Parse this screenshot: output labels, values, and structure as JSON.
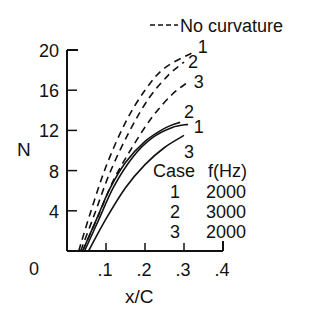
{
  "chart_data": {
    "type": "line",
    "title": "",
    "xlabel": "x/C",
    "ylabel": "N",
    "xlim": [
      0,
      0.4
    ],
    "ylim": [
      0,
      20
    ],
    "x_ticks": [
      0.1,
      0.2,
      0.3,
      0.4
    ],
    "x_tick_labels": [
      ".1",
      ".2",
      ".3",
      ".4"
    ],
    "y_ticks": [
      4,
      8,
      12,
      16,
      20
    ],
    "y_tick_labels": [
      "4",
      "8",
      "12",
      "16",
      "20"
    ],
    "origin_label": "0",
    "grid": false,
    "legend": {
      "dashed_label": "No curvature",
      "dashed_sample": "----",
      "table_headers": [
        "Case",
        "f(Hz)"
      ],
      "table_rows": [
        {
          "case": "1",
          "f": "2000"
        },
        {
          "case": "2",
          "f": "3000"
        },
        {
          "case": "3",
          "f": "2000"
        }
      ]
    },
    "series": [
      {
        "name": "1 (no curvature)",
        "case": "1",
        "style": "dashed",
        "x": [
          0.03,
          0.06,
          0.1,
          0.15,
          0.2,
          0.25,
          0.32
        ],
        "y": [
          0,
          3.8,
          8.4,
          12.8,
          16.0,
          18.2,
          19.7
        ]
      },
      {
        "name": "2 (no curvature)",
        "case": "2",
        "style": "dashed",
        "x": [
          0.035,
          0.07,
          0.11,
          0.16,
          0.21,
          0.26,
          0.3
        ],
        "y": [
          0,
          3.6,
          7.8,
          11.9,
          15.2,
          17.5,
          18.8
        ]
      },
      {
        "name": "3 (no curvature)",
        "case": "3",
        "style": "dashed",
        "x": [
          0.04,
          0.08,
          0.12,
          0.17,
          0.22,
          0.27,
          0.31
        ],
        "y": [
          0,
          3.5,
          7.1,
          10.5,
          13.4,
          15.6,
          16.8
        ]
      },
      {
        "name": "1",
        "case": "1",
        "style": "solid",
        "x": [
          0.045,
          0.08,
          0.12,
          0.17,
          0.22,
          0.27,
          0.31
        ],
        "y": [
          0,
          3.0,
          6.4,
          9.4,
          11.3,
          12.3,
          12.6
        ]
      },
      {
        "name": "2",
        "case": "2",
        "style": "solid",
        "x": [
          0.04,
          0.075,
          0.11,
          0.15,
          0.2,
          0.25,
          0.29
        ],
        "y": [
          0,
          3.1,
          6.2,
          8.8,
          10.9,
          12.2,
          12.8
        ]
      },
      {
        "name": "3",
        "case": "3",
        "style": "solid",
        "x": [
          0.055,
          0.1,
          0.15,
          0.2,
          0.25,
          0.3
        ],
        "y": [
          0,
          3.2,
          6.3,
          8.6,
          10.3,
          11.5
        ]
      }
    ],
    "curve_labels": [
      {
        "text": "1",
        "x": 0.335,
        "y": 20.4
      },
      {
        "text": "2",
        "x": 0.31,
        "y": 18.9
      },
      {
        "text": "3",
        "x": 0.325,
        "y": 16.9
      },
      {
        "text": "2",
        "x": 0.3,
        "y": 13.9
      },
      {
        "text": "1",
        "x": 0.325,
        "y": 12.4
      },
      {
        "text": "3",
        "x": 0.3,
        "y": 10.0
      }
    ]
  },
  "colors": {
    "ink": "#111111",
    "background": "#ffffff"
  }
}
